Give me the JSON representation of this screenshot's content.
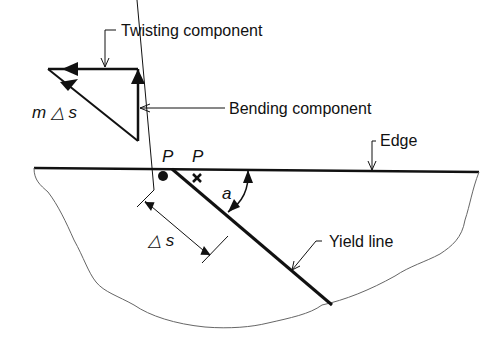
{
  "diagram": {
    "labels": {
      "twisting": "Twisting component",
      "bending": "Bending component",
      "moment": "m △ s",
      "edge": "Edge",
      "point_p1": "P",
      "point_p2": "P",
      "angle": "a",
      "delta_s": "△ s",
      "yield_line": "Yield line"
    },
    "colors": {
      "ink": "#111111",
      "boundary": "#666666",
      "background": "#ffffff"
    }
  }
}
